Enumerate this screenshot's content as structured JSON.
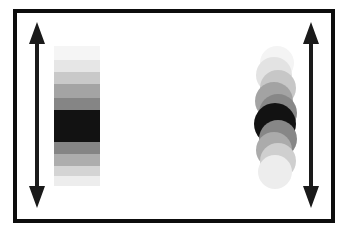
{
  "figure": {
    "background_color": "#ffffff",
    "frame_color": "#0d0d0d",
    "frame_width_px": 4
  },
  "annotations": {
    "arrows": [
      {
        "name": "left-vertical-double-arrow",
        "label": "",
        "direction": "vertical-double",
        "color": "#1a1a1a",
        "x_px": 9,
        "y_px": 9,
        "length_px": 186
      },
      {
        "name": "right-vertical-double-arrow",
        "label": "",
        "direction": "vertical-double",
        "color": "#1a1a1a",
        "x_px": 283,
        "y_px": 9,
        "length_px": 186
      }
    ]
  },
  "chart_data": {
    "type": "heatmap",
    "title": "",
    "subtitle": "",
    "xlabel": "",
    "ylabel": "",
    "grid": false,
    "legend": "none",
    "objects": [
      {
        "name": "banded-rectangle",
        "shape": "rectangle-bands",
        "description": "Vertical stack of horizontal grayscale bands, darkest at center",
        "x_px": 37,
        "y_px": 33,
        "width_px": 46,
        "height_px": 140,
        "bands": [
          {
            "index": 0,
            "label": "band-1",
            "height_px": 14,
            "gray": 0.96,
            "color": "#f5f5f5"
          },
          {
            "index": 1,
            "label": "band-2",
            "height_px": 12,
            "gray": 0.9,
            "color": "#e6e6e6"
          },
          {
            "index": 2,
            "label": "band-3",
            "height_px": 12,
            "gray": 0.79,
            "color": "#c9c9c9"
          },
          {
            "index": 3,
            "label": "band-4",
            "height_px": 14,
            "gray": 0.64,
            "color": "#a4a4a4"
          },
          {
            "index": 4,
            "label": "band-5",
            "height_px": 12,
            "gray": 0.52,
            "color": "#858585"
          },
          {
            "index": 5,
            "label": "band-6-core",
            "height_px": 32,
            "gray": 0.07,
            "color": "#121212"
          },
          {
            "index": 6,
            "label": "band-7",
            "height_px": 12,
            "gray": 0.52,
            "color": "#858585"
          },
          {
            "index": 7,
            "label": "band-8",
            "height_px": 12,
            "gray": 0.68,
            "color": "#adadad"
          },
          {
            "index": 8,
            "label": "band-9",
            "height_px": 10,
            "gray": 0.83,
            "color": "#d4d4d4"
          },
          {
            "index": 9,
            "label": "band-10",
            "height_px": 10,
            "gray": 0.93,
            "color": "#ededed"
          }
        ]
      },
      {
        "name": "circle-stack",
        "shape": "overlapping-circles",
        "description": "Vertical stack of overlapping circles, darkest at center",
        "x_px": 231,
        "y_px": 31,
        "width_px": 56,
        "height_px": 146,
        "discs": [
          {
            "index": 0,
            "label": "disc-1",
            "cx_px": 29,
            "cy_px": 19,
            "r_px": 17,
            "gray": 0.96,
            "color": "#f4f4f4"
          },
          {
            "index": 1,
            "label": "disc-2",
            "cx_px": 26,
            "cy_px": 31,
            "r_px": 18,
            "gray": 0.89,
            "color": "#e3e3e3"
          },
          {
            "index": 2,
            "label": "disc-3",
            "cx_px": 30,
            "cy_px": 44,
            "r_px": 18,
            "gray": 0.78,
            "color": "#c7c7c7"
          },
          {
            "index": 3,
            "label": "disc-4",
            "cx_px": 26,
            "cy_px": 57,
            "r_px": 19,
            "gray": 0.64,
            "color": "#a3a3a3"
          },
          {
            "index": 4,
            "label": "disc-5",
            "cx_px": 30,
            "cy_px": 69,
            "r_px": 19,
            "gray": 0.53,
            "color": "#878787"
          },
          {
            "index": 5,
            "label": "disc-6-core",
            "cx_px": 27,
            "cy_px": 80,
            "r_px": 21,
            "gray": 0.07,
            "color": "#121212"
          },
          {
            "index": 6,
            "label": "disc-7",
            "cx_px": 30,
            "cy_px": 95,
            "r_px": 19,
            "gray": 0.53,
            "color": "#878787"
          },
          {
            "index": 7,
            "label": "disc-8",
            "cx_px": 26,
            "cy_px": 106,
            "r_px": 18,
            "gray": 0.67,
            "color": "#ababab"
          },
          {
            "index": 8,
            "label": "disc-9",
            "cx_px": 30,
            "cy_px": 117,
            "r_px": 18,
            "gray": 0.81,
            "color": "#cfcfcf"
          },
          {
            "index": 9,
            "label": "disc-10",
            "cx_px": 27,
            "cy_px": 128,
            "r_px": 17,
            "gray": 0.93,
            "color": "#ededed"
          }
        ]
      }
    ]
  }
}
